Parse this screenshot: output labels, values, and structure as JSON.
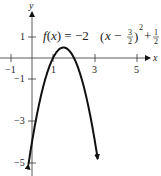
{
  "chart_data": {
    "type": "line",
    "function": "-2*(x-1.5)^2+0.5",
    "xlabel": "x",
    "ylabel": "y",
    "xlim": [
      -1.5,
      6
    ],
    "ylim": [
      -5.5,
      2
    ],
    "x_ticks": [
      -1,
      1,
      3,
      5
    ],
    "x_tick_labels": [
      "−1",
      "1",
      "3",
      "5"
    ],
    "y_ticks": [
      1,
      -1,
      -3,
      -5
    ],
    "y_tick_labels": [
      "1",
      "−1",
      "−3",
      "−5"
    ],
    "vertex": [
      1.5,
      0.5
    ],
    "x_intercepts": [
      1,
      2
    ],
    "series": [
      {
        "name": "f(x)",
        "x": [
          -0.15,
          0,
          0.5,
          1,
          1.5,
          2,
          2.5,
          3,
          3.15
        ],
        "y": [
          -4.95,
          -4,
          -1.5,
          0,
          0.5,
          0,
          -1.5,
          -4,
          -4.95
        ]
      }
    ],
    "grid": false,
    "arrows_at_ends": true
  },
  "labels": {
    "x_axis": "x",
    "y_axis": "y",
    "eq_lhs": "f(x) = −2",
    "eq_paren_open": "(",
    "eq_x_minus": "x −",
    "eq_frac1_num": "3",
    "eq_frac1_den": "2",
    "eq_paren_close": ")",
    "eq_exp": "2",
    "eq_plus": "+",
    "eq_frac2_num": "1",
    "eq_frac2_den": "2",
    "tick_xm1": "−1",
    "tick_x1": "1",
    "tick_x3": "3",
    "tick_x5": "5",
    "tick_y1": "1",
    "tick_ym1": "−1",
    "tick_ym3": "−3",
    "tick_ym5": "−5"
  }
}
